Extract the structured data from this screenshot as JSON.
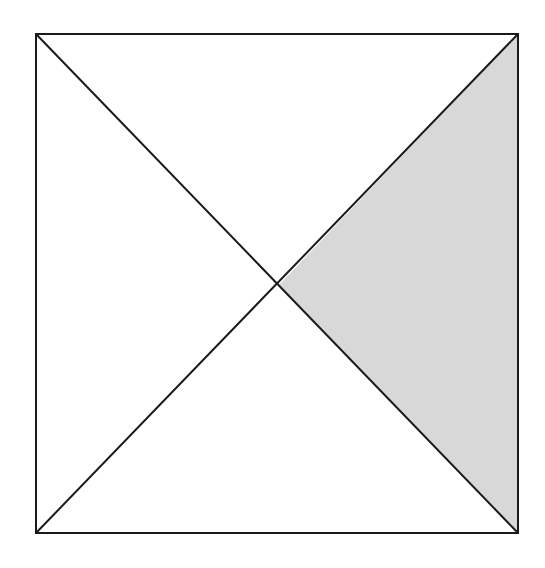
{
  "diagram": {
    "type": "square-with-diagonals",
    "square": {
      "x1": 36,
      "y1": 34,
      "x2": 518,
      "y2": 533
    },
    "center": {
      "x": 279,
      "y": 285
    },
    "shaded_region": "right-triangle",
    "colors": {
      "background": "#ffffff",
      "stroke": "#1a1a1a",
      "fill": "#d8d8d8"
    },
    "stroke_width": 2
  }
}
